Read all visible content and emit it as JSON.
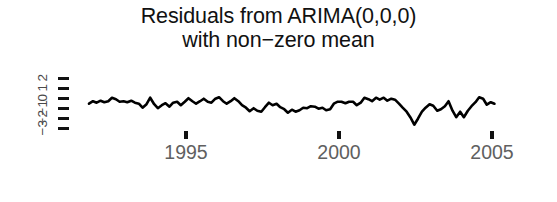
{
  "title": {
    "line1": "Residuals from ARIMA(0,0,0)",
    "line2": "with non−zero mean"
  },
  "chart_data": {
    "type": "line",
    "title": "Residuals from ARIMA(0,0,0)\nwith non−zero mean",
    "xlabel": "",
    "ylabel": "",
    "grid": false,
    "legend": null,
    "line_color": "#000000",
    "line_width": 2.6,
    "xlim": [
      1991.8,
      2005.3
    ],
    "ylim": [
      -3.4,
      2.4
    ],
    "xticks": [
      1995,
      2000,
      2005
    ],
    "xticklabels": [
      "1995",
      "2000",
      "2005"
    ],
    "yticks": [
      2,
      1,
      0,
      -1,
      -2,
      -3
    ],
    "yticklabels": [
      "2",
      "1",
      "0",
      "−1",
      "−2",
      "−3"
    ],
    "x": [
      1991.83,
      1991.96,
      1992.08,
      1992.21,
      1992.33,
      1992.46,
      1992.58,
      1992.71,
      1992.83,
      1992.96,
      1993.08,
      1993.21,
      1993.33,
      1993.46,
      1993.58,
      1993.71,
      1993.83,
      1993.96,
      1994.08,
      1994.21,
      1994.33,
      1994.46,
      1994.58,
      1994.71,
      1994.83,
      1994.96,
      1995.08,
      1995.21,
      1995.33,
      1995.46,
      1995.58,
      1995.71,
      1995.83,
      1995.96,
      1996.08,
      1996.21,
      1996.33,
      1996.46,
      1996.58,
      1996.71,
      1996.83,
      1996.96,
      1997.08,
      1997.21,
      1997.33,
      1997.46,
      1997.58,
      1997.71,
      1997.83,
      1997.96,
      1998.08,
      1998.21,
      1998.33,
      1998.46,
      1998.58,
      1998.71,
      1998.83,
      1998.96,
      1999.08,
      1999.21,
      1999.33,
      1999.46,
      1999.58,
      1999.71,
      1999.83,
      1999.96,
      2000.08,
      2000.21,
      2000.33,
      2000.46,
      2000.58,
      2000.71,
      2000.83,
      2000.96,
      2001.08,
      2001.21,
      2001.33,
      2001.46,
      2001.58,
      2001.71,
      2001.83,
      2001.96,
      2002.08,
      2002.21,
      2002.33,
      2002.46,
      2002.58,
      2002.71,
      2002.83,
      2002.96,
      2003.08,
      2003.21,
      2003.33,
      2003.46,
      2003.58,
      2003.71,
      2003.83,
      2003.96,
      2004.08,
      2004.21,
      2004.33,
      2004.46,
      2004.58,
      2004.71,
      2004.83,
      2004.96,
      2005.08
    ],
    "y": [
      -0.55,
      -0.3,
      -0.45,
      -0.25,
      -0.4,
      -0.3,
      0.05,
      -0.1,
      -0.35,
      -0.3,
      -0.4,
      -0.25,
      -0.45,
      -0.55,
      -0.95,
      -0.6,
      0.05,
      -0.6,
      -1.0,
      -0.7,
      -0.5,
      -0.85,
      -0.45,
      -0.35,
      -0.7,
      -0.35,
      0.0,
      -0.3,
      -0.55,
      -0.3,
      -0.05,
      -0.35,
      -0.45,
      -0.05,
      0.1,
      -0.3,
      -0.55,
      -0.3,
      0.0,
      -0.3,
      -0.7,
      -0.95,
      -1.3,
      -1.0,
      -1.25,
      -1.35,
      -0.9,
      -0.45,
      -0.7,
      -0.55,
      -0.9,
      -1.1,
      -1.45,
      -1.15,
      -1.35,
      -1.2,
      -0.95,
      -1.0,
      -0.8,
      -0.85,
      -1.05,
      -0.95,
      -1.2,
      -1.1,
      -0.55,
      -0.35,
      -0.35,
      -0.5,
      -0.35,
      -0.35,
      -0.7,
      -0.45,
      0.05,
      -0.1,
      -0.3,
      0.05,
      -0.15,
      0.05,
      -0.25,
      -0.05,
      -0.15,
      -0.55,
      -0.95,
      -1.35,
      -1.9,
      -2.65,
      -2.05,
      -1.35,
      -0.95,
      -0.6,
      -0.75,
      -1.25,
      -1.1,
      -0.8,
      -0.3,
      -1.25,
      -1.9,
      -1.35,
      -1.9,
      -1.25,
      -0.8,
      -0.4,
      0.1,
      -0.05,
      -0.65,
      -0.4,
      -0.55
    ]
  },
  "y_axis": {
    "ticks": [
      {
        "value": 2,
        "label": "2"
      },
      {
        "value": 1,
        "label": "1"
      },
      {
        "value": 0,
        "label": "0"
      },
      {
        "value": -1,
        "label": "−1"
      },
      {
        "value": -2,
        "label": "−2"
      },
      {
        "value": -3,
        "label": "−3"
      }
    ]
  },
  "x_axis": {
    "ticks": [
      {
        "value": 1995,
        "label": "1995"
      },
      {
        "value": 2000,
        "label": "2000"
      },
      {
        "value": 2005,
        "label": "2005"
      }
    ]
  }
}
